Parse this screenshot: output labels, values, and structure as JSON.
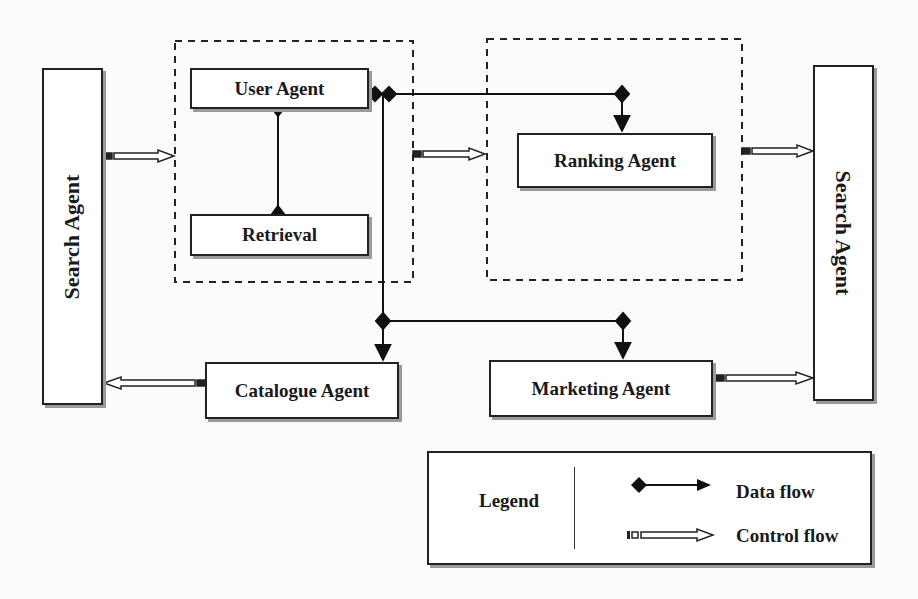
{
  "diagram": {
    "type": "agent-architecture",
    "nodes": {
      "search_agent_left": {
        "label": "Search Agent"
      },
      "user_agent": {
        "label": "User Agent"
      },
      "retrieval": {
        "label": "Retrieval"
      },
      "ranking_agent": {
        "label": "Ranking Agent"
      },
      "search_agent_right": {
        "label": "Search Agent"
      },
      "catalogue_agent": {
        "label": "Catalogue Agent"
      },
      "marketing_agent": {
        "label": "Marketing Agent"
      }
    },
    "groups": [
      {
        "name": "user-retrieval-group",
        "members": [
          "user_agent",
          "retrieval"
        ],
        "style": "dashed"
      },
      {
        "name": "ranking-group",
        "members": [
          "ranking_agent"
        ],
        "style": "dashed"
      }
    ],
    "edges": [
      {
        "from": "user_agent",
        "to": "retrieval",
        "type": "data"
      },
      {
        "from": "user_agent",
        "to": "ranking_agent",
        "type": "data"
      },
      {
        "from": "user_agent",
        "to": "catalogue_agent",
        "type": "data"
      },
      {
        "from": "user_agent",
        "to": "marketing_agent",
        "type": "data"
      },
      {
        "from": "search_agent_left",
        "to": "user-retrieval-group",
        "type": "control"
      },
      {
        "from": "user-retrieval-group",
        "to": "ranking-group",
        "type": "control"
      },
      {
        "from": "ranking-group",
        "to": "search_agent_right",
        "type": "control"
      },
      {
        "from": "catalogue_agent",
        "to": "search_agent_left",
        "type": "control"
      },
      {
        "from": "marketing_agent",
        "to": "search_agent_right",
        "type": "control"
      }
    ]
  },
  "legend": {
    "title": "Legend",
    "items": [
      {
        "label": "Data flow",
        "symbol": "diamond-line-arrow"
      },
      {
        "label": "Control flow",
        "symbol": "hollow-double-arrow"
      }
    ]
  }
}
